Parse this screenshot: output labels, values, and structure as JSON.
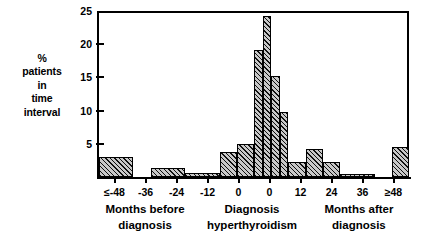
{
  "chart_data": {
    "type": "bar",
    "title": "",
    "subtitle": "",
    "xlabel": "Months before diagnosis / Diagnosis hyperthyroidism / Months after diagnosis",
    "ylabel": "% patients in time interval",
    "ylim": [
      0,
      25
    ],
    "ytick_values": [
      0,
      5,
      10,
      15,
      20,
      25
    ],
    "ytick_labels": [
      "",
      "5",
      "10",
      "15",
      "20",
      "25"
    ],
    "xlim": [
      -54,
      54
    ],
    "xtick_values": [
      -48,
      -36,
      -24,
      -12,
      0,
      0,
      12,
      24,
      36,
      48
    ],
    "xtick_labels": [
      "≤-48",
      "-36",
      "-24",
      "-12",
      "0",
      "0",
      "12",
      "24",
      "36",
      "≥48"
    ],
    "grid": false,
    "legend": null,
    "bar_fill": "#c8c8c8",
    "bar_hatch": "diagonal-crosshatch",
    "bar_edge_color": "#000000",
    "categories": [
      "≤-48",
      "-48 to -36",
      "-36 to -24",
      "-24 to -12",
      "-12 to -6",
      "-6 to 0",
      "0 to 3",
      "3 to 6",
      "6 to 9",
      "9 to 12",
      "12 to 18",
      "18 to 24",
      "24 to 30",
      "30 to 42",
      "≥48"
    ],
    "values": [
      3.0,
      0,
      1.3,
      0.6,
      3.7,
      5.0,
      19.2,
      24.2,
      15.2,
      9.8,
      2.2,
      4.2,
      2.2,
      0.3,
      4.5
    ],
    "bin_start": [
      -54,
      -48,
      -36,
      -24,
      -12,
      -6,
      0,
      3,
      6,
      9,
      12,
      18,
      24,
      30,
      48
    ],
    "bin_end": [
      -42,
      -36,
      -24,
      -12,
      -6,
      0,
      3,
      6,
      9,
      12,
      18,
      24,
      30,
      42,
      54
    ]
  },
  "axis": {
    "ylabel_lines": [
      "%",
      "patients",
      "in",
      "time",
      "interval"
    ],
    "ytick_labels": [
      "25",
      "20",
      "15",
      "10",
      "5"
    ],
    "xtick_labels": [
      "≤-48",
      "-36",
      "-24",
      "-12",
      "0",
      "0",
      "12",
      "24",
      "36",
      "≥48"
    ],
    "xgroups": [
      {
        "lines": [
          "Months before",
          "diagnosis"
        ]
      },
      {
        "lines": [
          "Diagnosis",
          "hyperthyroidism"
        ]
      },
      {
        "lines": [
          "Months after",
          "diagnosis"
        ]
      }
    ]
  }
}
